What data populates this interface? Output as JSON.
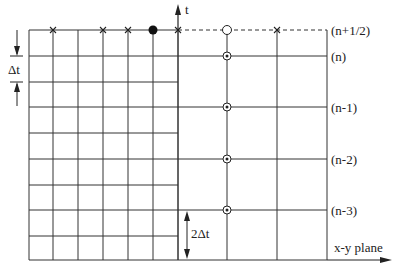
{
  "diagram": {
    "axis_t_label": "t",
    "axis_xy_label": "x-y plane",
    "dt_label": "Δt",
    "two_dt_label": "2Δt",
    "time_levels": [
      {
        "label": "(n+1/2)",
        "y": 30
      },
      {
        "label": "(n)",
        "y": 56
      },
      {
        "label": "(n-1)",
        "y": 107
      },
      {
        "label": "(n-2)",
        "y": 159
      },
      {
        "label": "(n-3)",
        "y": 210
      }
    ],
    "fine_grid": {
      "x_lines": [
        29,
        53,
        78,
        103,
        128,
        153,
        178
      ],
      "y_lines": [
        30,
        56,
        82,
        107,
        133,
        159,
        185,
        210,
        236,
        260
      ]
    },
    "coarse_grid": {
      "x_lines": [
        178,
        227,
        277,
        327
      ],
      "y_lines": [
        56,
        107,
        159,
        210,
        260
      ]
    },
    "markers": {
      "cross_points_x": [
        53,
        103,
        128,
        178,
        277
      ],
      "filled_dot_x": 153,
      "open_circle_x": 227,
      "circled_dot_ys": [
        56,
        107,
        159,
        210
      ]
    },
    "colors": {
      "line": "#333333",
      "background": "#ffffff"
    }
  }
}
